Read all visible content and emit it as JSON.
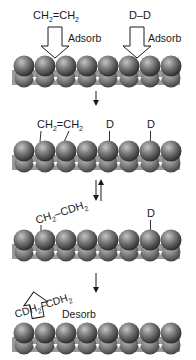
{
  "diagram": {
    "type": "surface-reaction-mechanism",
    "colors": {
      "background": "#ffffff",
      "sphere_light": "#b8b8b8",
      "sphere_mid": "#6e6e6e",
      "sphere_dark": "#2e2e2e",
      "substrate_band": "#9a9a9a",
      "text": "#1a1a1a",
      "arrow_fill": "#ffffff",
      "arrow_stroke": "#1a1a1a"
    },
    "surface": {
      "sphere_count": 8
    },
    "steps": [
      {
        "id": "step1",
        "labels": {
          "ethylene": "CH₂=CH₂",
          "ethylene_main": "CH",
          "ethylene_sub1": "2",
          "ethylene_mid": "=CH",
          "ethylene_sub2": "2",
          "deuterium": "D–D",
          "adsorb_left": "Adsorb",
          "adsorb_right": "Adsorb"
        }
      },
      {
        "id": "step2",
        "labels": {
          "ethylene_main": "CH",
          "ethylene_sub1": "2",
          "ethylene_mid": "=CH",
          "ethylene_sub2": "2",
          "d1": "D",
          "d2": "D"
        }
      },
      {
        "id": "step3",
        "labels": {
          "ethyl_main": "CH",
          "ethyl_sub1": "2",
          "ethyl_mid": "–CDH",
          "ethyl_sub2": "2",
          "d1": "D"
        }
      },
      {
        "id": "step4",
        "labels": {
          "product_left": "CDH",
          "product_sub": "2",
          "product_right": "CDH",
          "product_sub2": "2",
          "desorb": "Desorb"
        }
      }
    ],
    "transitions": [
      {
        "from": "step1",
        "to": "step2",
        "kind": "forward"
      },
      {
        "from": "step2",
        "to": "step3",
        "kind": "equilibrium"
      },
      {
        "from": "step3",
        "to": "step4",
        "kind": "forward"
      }
    ]
  }
}
